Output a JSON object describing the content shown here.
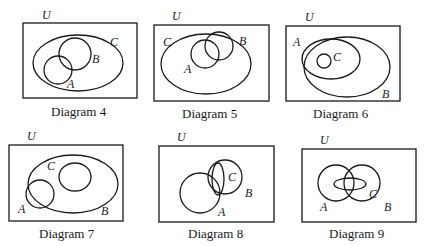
{
  "diagrams": [
    {
      "caption": "Diagram 4",
      "universe_label": "U",
      "sets": {
        "A": "A",
        "B": "B",
        "C": "C"
      },
      "relation": "A and B overlap; both inside C"
    },
    {
      "caption": "Diagram 5",
      "universe_label": "U",
      "sets": {
        "A": "A",
        "B": "B",
        "C": "C"
      },
      "relation": "A inside C; B overlaps A and C"
    },
    {
      "caption": "Diagram 6",
      "universe_label": "U",
      "sets": {
        "A": "A",
        "B": "B",
        "C": "C"
      },
      "relation": "A and B overlap; C inside A∩B"
    },
    {
      "caption": "Diagram 7",
      "universe_label": "U",
      "sets": {
        "A": "A",
        "B": "B",
        "C": "C"
      },
      "relation": "C inside B; A overlaps B, disjoint from C"
    },
    {
      "caption": "Diagram 8",
      "universe_label": "U",
      "sets": {
        "A": "A",
        "B": "B",
        "C": "C"
      },
      "relation": "C inside B; A overlaps B and C"
    },
    {
      "caption": "Diagram 9",
      "universe_label": "U",
      "sets": {
        "A": "A",
        "B": "B",
        "C": "C"
      },
      "relation": "A and B overlap; C overlaps A and B across intersection"
    }
  ]
}
